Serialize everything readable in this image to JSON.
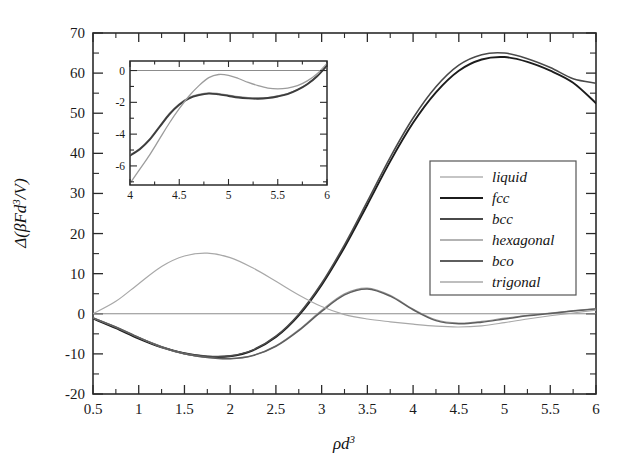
{
  "figure": {
    "background": "#ffffff",
    "axis_color": "#2b2b2b"
  },
  "chart_data": {
    "type": "line",
    "title": "",
    "xlabel": "ρd³",
    "ylabel": "Δ(βFd³/V)",
    "xlim": [
      0.5,
      6
    ],
    "ylim": [
      -20,
      70
    ],
    "xticks": [
      "0.5",
      "1",
      "1.5",
      "2",
      "2.5",
      "3",
      "3.5",
      "4",
      "4.5",
      "5",
      "5.5",
      "6"
    ],
    "xtick_values": [
      0.5,
      1,
      1.5,
      2,
      2.5,
      3,
      3.5,
      4,
      4.5,
      5,
      5.5,
      6
    ],
    "yticks": [
      "70",
      "60",
      "50",
      "40",
      "30",
      "20",
      "10",
      "0",
      "-10",
      "-20"
    ],
    "ytick_values": [
      70,
      60,
      50,
      40,
      30,
      20,
      10,
      0,
      -10,
      -20
    ],
    "grid": false,
    "legend_position": "center-right",
    "x": [
      0.5,
      0.75,
      1.0,
      1.25,
      1.5,
      1.75,
      2.0,
      2.25,
      2.5,
      2.75,
      3.0,
      3.25,
      3.5,
      3.75,
      4.0,
      4.25,
      4.5,
      4.75,
      5.0,
      5.25,
      5.5,
      5.75,
      6.0
    ],
    "series": [
      {
        "name": "liquid",
        "color": "#8c8c8c",
        "width": 1.1,
        "values": [
          0,
          0,
          0,
          0,
          0,
          0,
          0,
          0,
          0,
          0,
          0,
          0,
          0,
          0,
          0,
          0,
          0,
          0,
          0,
          0,
          0,
          0,
          0
        ]
      },
      {
        "name": "fcc",
        "color": "#1c1c1c",
        "width": 1.9,
        "values": [
          -1.2,
          -3.6,
          -6.2,
          -8.4,
          -9.9,
          -10.7,
          -10.6,
          -9.1,
          -5.8,
          -0.4,
          7.2,
          16.6,
          27.2,
          38.0,
          47.6,
          55.2,
          60.6,
          63.4,
          64.0,
          62.8,
          60.6,
          57.6,
          52.5
        ]
      },
      {
        "name": "bcc",
        "color": "#4a4a4a",
        "width": 1.6,
        "values": [
          -1.1,
          -3.4,
          -6.0,
          -8.2,
          -9.8,
          -10.6,
          -10.5,
          -9.0,
          -5.6,
          -0.1,
          7.6,
          17.2,
          28.0,
          39.0,
          48.8,
          56.6,
          62.0,
          64.6,
          65.0,
          63.6,
          61.4,
          58.6,
          57.5
        ]
      },
      {
        "name": "hexagonal",
        "color": "#9a9a9a",
        "width": 1.2,
        "values": [
          -1.0,
          -3.3,
          -5.9,
          -8.3,
          -10.0,
          -10.9,
          -11.2,
          -10.4,
          -8.0,
          -4.0,
          0.9,
          5.0,
          6.4,
          4.6,
          1.2,
          -1.5,
          -2.3,
          -1.9,
          -1.1,
          -0.4,
          0.2,
          0.8,
          1.3
        ]
      },
      {
        "name": "bco",
        "color": "#5e5e5e",
        "width": 1.5,
        "values": [
          -1.0,
          -3.3,
          -5.9,
          -8.3,
          -10.0,
          -10.9,
          -11.2,
          -10.4,
          -8.1,
          -4.2,
          0.6,
          4.7,
          6.2,
          4.4,
          1.0,
          -1.7,
          -2.5,
          -2.1,
          -1.3,
          -0.5,
          0.1,
          0.7,
          1.2
        ]
      },
      {
        "name": "trigonal",
        "color": "#a8a8a8",
        "width": 1.2,
        "values": [
          0.0,
          3.1,
          7.5,
          11.8,
          14.4,
          15.1,
          14.0,
          11.4,
          8.1,
          4.7,
          1.8,
          -0.2,
          -1.3,
          -2.0,
          -2.6,
          -3.1,
          -3.3,
          -3.0,
          -2.2,
          -1.3,
          -0.5,
          0.2,
          0.9
        ]
      }
    ]
  },
  "inset": {
    "xlim": [
      4,
      6
    ],
    "ylim": [
      -7.2,
      0.6
    ],
    "xticks": [
      "4",
      "4.5",
      "5",
      "5.5",
      "6"
    ],
    "xtick_values": [
      4,
      4.5,
      5,
      5.5,
      6
    ],
    "yticks": [
      "0",
      "-2",
      "-4",
      "-6"
    ],
    "ytick_values": [
      0,
      -2,
      -4,
      -6
    ],
    "x": [
      4.0,
      4.1,
      4.2,
      4.3,
      4.4,
      4.5,
      4.6,
      4.7,
      4.8,
      4.9,
      5.0,
      5.1,
      5.2,
      5.3,
      5.4,
      5.5,
      5.6,
      5.7,
      5.8,
      5.9,
      6.0
    ],
    "series": [
      {
        "name": "liquid",
        "color": "#8c8c8c",
        "width": 1.1,
        "values": [
          0,
          0,
          0,
          0,
          0,
          0,
          0,
          0,
          0,
          0,
          0,
          0,
          0,
          0,
          0,
          0,
          0,
          0,
          0,
          0,
          0
        ]
      },
      {
        "name": "hexagonal",
        "color": "#8f8f8f",
        "width": 1.3,
        "values": [
          -5.3,
          -4.9,
          -4.3,
          -3.5,
          -2.7,
          -2.1,
          -1.7,
          -1.5,
          -1.4,
          -1.45,
          -1.55,
          -1.65,
          -1.7,
          -1.72,
          -1.7,
          -1.6,
          -1.45,
          -1.2,
          -0.85,
          -0.35,
          0.3
        ]
      },
      {
        "name": "bco",
        "color": "#3d3d3d",
        "width": 1.9,
        "values": [
          -5.35,
          -4.95,
          -4.35,
          -3.55,
          -2.75,
          -2.15,
          -1.75,
          -1.55,
          -1.45,
          -1.5,
          -1.6,
          -1.7,
          -1.75,
          -1.77,
          -1.73,
          -1.63,
          -1.48,
          -1.22,
          -0.86,
          -0.36,
          0.32
        ]
      },
      {
        "name": "trigonal",
        "color": "#9c9c9c",
        "width": 1.3,
        "values": [
          -7.1,
          -6.2,
          -5.3,
          -4.3,
          -3.3,
          -2.4,
          -1.6,
          -0.95,
          -0.45,
          -0.25,
          -0.3,
          -0.5,
          -0.75,
          -0.95,
          -1.1,
          -1.15,
          -1.1,
          -0.95,
          -0.65,
          -0.2,
          0.45
        ]
      }
    ]
  },
  "legend": {
    "items": [
      {
        "label": "liquid",
        "color": "#8c8c8c",
        "width": 1.2
      },
      {
        "label": "fcc",
        "color": "#1c1c1c",
        "width": 2.2
      },
      {
        "label": "bcc",
        "color": "#4a4a4a",
        "width": 1.9
      },
      {
        "label": "hexagonal",
        "color": "#9a9a9a",
        "width": 1.3
      },
      {
        "label": "bco",
        "color": "#5e5e5e",
        "width": 1.8
      },
      {
        "label": "trigonal",
        "color": "#a8a8a8",
        "width": 1.3
      }
    ]
  }
}
